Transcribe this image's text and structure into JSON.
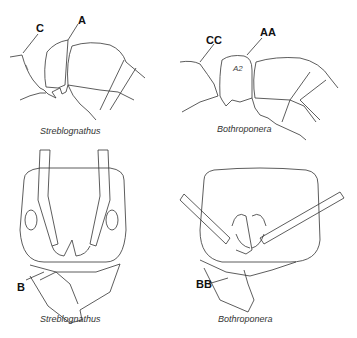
{
  "panels": [
    {
      "id": "top-left",
      "caption": "Streblognathus",
      "labels": [
        "C",
        "A"
      ]
    },
    {
      "id": "top-right",
      "caption": "Bothroponera",
      "labels": [
        "CC",
        "AA"
      ],
      "inner_label": "A2"
    },
    {
      "id": "bottom-left",
      "caption": "Streblognathus",
      "labels": [
        "B"
      ]
    },
    {
      "id": "bottom-right",
      "caption": "Bothroponera",
      "labels": [
        "BB"
      ]
    }
  ]
}
